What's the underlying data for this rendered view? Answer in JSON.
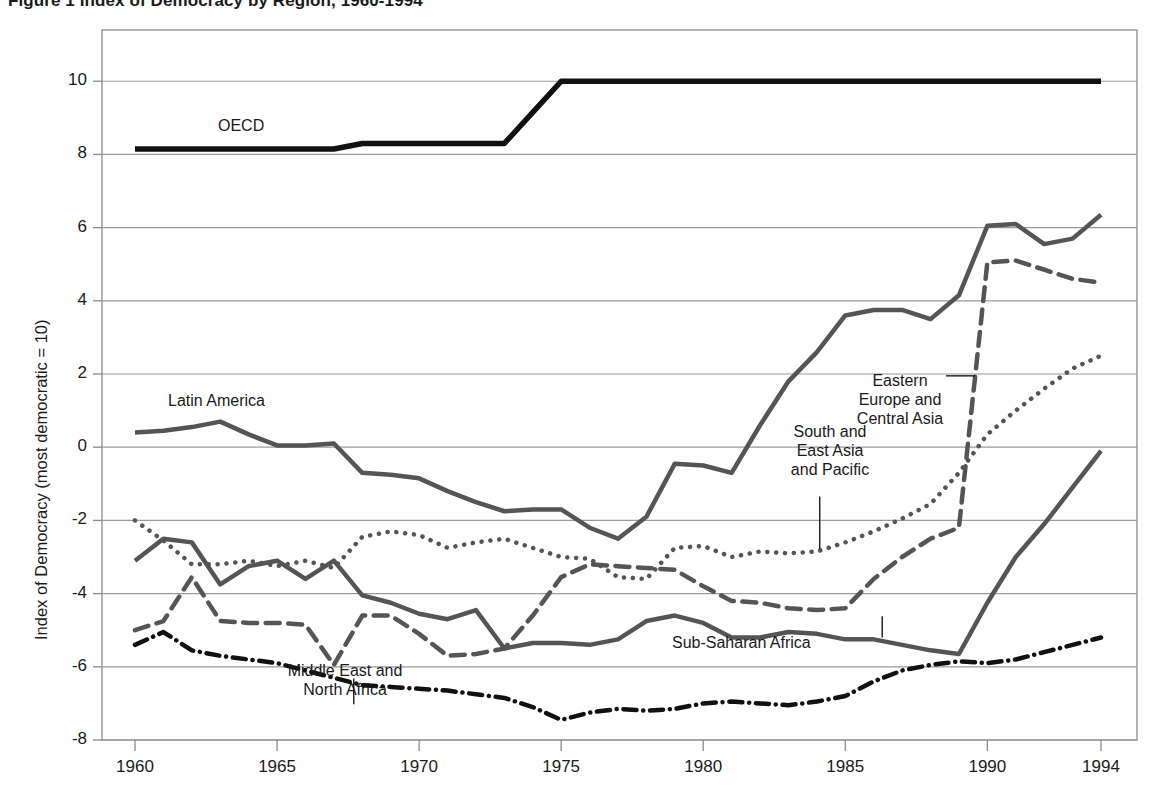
{
  "figure": {
    "title": "Figure 1  Index of Democracy by Region, 1960-1994",
    "ylabel": "Index of Democracy (most democratic = 10)"
  },
  "axes": {
    "y_ticks": [
      "10",
      "8",
      "6",
      "4",
      "2",
      "0",
      "-2",
      "-4",
      "-6",
      "-8"
    ],
    "x_ticks": [
      "1960",
      "1965",
      "1970",
      "1975",
      "1980",
      "1985",
      "1990",
      "1994"
    ]
  },
  "labels": {
    "oecd": "OECD",
    "latin_america": "Latin America",
    "eastern_europe": "Eastern\nEurope and\nCentral Asia",
    "south_east_asia": "South and\nEast Asia\nand Pacific",
    "sub_saharan": "Sub-Saharan Africa",
    "middle_east": "Middle East and\nNorth Africa"
  },
  "colors": {
    "oecd": "#111111",
    "latin_america": "#555555",
    "eastern_europe": "#555555",
    "south_east_asia": "#555555",
    "sub_saharan": "#555555",
    "middle_east": "#111111",
    "grid": "#9a9a9a",
    "axis": "#8a8a8a"
  },
  "chart_data": {
    "type": "line",
    "title": "Index of Democracy by Region, 1960-1994",
    "xlabel": "",
    "ylabel": "Index of Democracy (most democratic = 10)",
    "xlim": [
      1959,
      1995
    ],
    "ylim": [
      -8,
      11.4
    ],
    "ytick_values": [
      10,
      8,
      6,
      4,
      2,
      0,
      -2,
      -4,
      -6,
      -8
    ],
    "xtick_values": [
      1960,
      1965,
      1970,
      1975,
      1980,
      1985,
      1990,
      1994
    ],
    "grid": "horizontal",
    "legend": "inline-annotations",
    "x": [
      1960,
      1961,
      1962,
      1963,
      1964,
      1965,
      1966,
      1967,
      1968,
      1969,
      1970,
      1971,
      1972,
      1973,
      1974,
      1975,
      1976,
      1977,
      1978,
      1979,
      1980,
      1981,
      1982,
      1983,
      1984,
      1985,
      1986,
      1987,
      1988,
      1989,
      1990,
      1991,
      1992,
      1993,
      1994
    ],
    "series": [
      {
        "name": "OECD",
        "style": "solid",
        "color": "#111111",
        "width": 5.5,
        "values": [
          8.15,
          8.15,
          8.15,
          8.15,
          8.15,
          8.15,
          8.15,
          8.15,
          8.3,
          8.3,
          8.3,
          8.3,
          8.3,
          8.3,
          9.15,
          10.0,
          10.0,
          10.0,
          10.0,
          10.0,
          10.0,
          10.0,
          10.0,
          10.0,
          10.0,
          10.0,
          10.0,
          10.0,
          10.0,
          10.0,
          10.0,
          10.0,
          10.0,
          10.0,
          10.0
        ]
      },
      {
        "name": "Latin America",
        "style": "solid",
        "color": "#555555",
        "width": 4.5,
        "values": [
          0.4,
          0.45,
          0.55,
          0.7,
          0.35,
          0.05,
          0.05,
          0.1,
          -0.7,
          -0.75,
          -0.85,
          -1.2,
          -1.5,
          -1.75,
          -1.7,
          -1.7,
          -2.2,
          -2.5,
          -1.9,
          -0.45,
          -0.5,
          -0.7,
          0.6,
          1.8,
          2.6,
          3.6,
          3.75,
          3.75,
          3.5,
          4.15,
          6.05,
          6.1,
          5.55,
          5.7,
          6.35
        ]
      },
      {
        "name": "Eastern Europe and Central Asia",
        "style": "dashed",
        "color": "#555555",
        "width": 4.5,
        "values": [
          -5.0,
          -4.75,
          -3.55,
          -4.75,
          -4.8,
          -4.8,
          -4.85,
          -5.95,
          -4.6,
          -4.6,
          -5.1,
          -5.7,
          -5.65,
          -5.5,
          -4.6,
          -3.55,
          -3.2,
          -3.25,
          -3.3,
          -3.35,
          -3.8,
          -4.2,
          -4.25,
          -4.4,
          -4.45,
          -4.4,
          -3.6,
          -3.0,
          -2.5,
          -2.2,
          5.05,
          5.1,
          4.85,
          4.6,
          4.5
        ]
      },
      {
        "name": "South and East Asia and Pacific",
        "style": "dotted",
        "color": "#555555",
        "width": 4.5,
        "values": [
          -2.0,
          -2.55,
          -3.2,
          -3.2,
          -3.1,
          -3.25,
          -3.1,
          -3.3,
          -2.45,
          -2.3,
          -2.4,
          -2.75,
          -2.6,
          -2.5,
          -2.75,
          -3.0,
          -3.05,
          -3.55,
          -3.6,
          -2.75,
          -2.7,
          -3.0,
          -2.85,
          -2.9,
          -2.85,
          -2.6,
          -2.3,
          -1.95,
          -1.55,
          -0.7,
          0.35,
          1.0,
          1.6,
          2.15,
          2.5
        ]
      },
      {
        "name": "Sub-Saharan Africa",
        "style": "solid",
        "color": "#555555",
        "width": 4.5,
        "values": [
          -3.1,
          -2.5,
          -2.6,
          -3.75,
          -3.25,
          -3.1,
          -3.6,
          -3.1,
          -4.05,
          -4.25,
          -4.55,
          -4.7,
          -4.45,
          -5.5,
          -5.35,
          -5.35,
          -5.4,
          -5.25,
          -4.75,
          -4.6,
          -4.8,
          -5.2,
          -5.2,
          -5.05,
          -5.1,
          -5.25,
          -5.25,
          -5.4,
          -5.55,
          -5.65,
          -4.25,
          -3.0,
          -2.1,
          -1.1,
          -0.1
        ]
      },
      {
        "name": "Middle East and North Africa",
        "style": "dashdot",
        "color": "#111111",
        "width": 4.5,
        "values": [
          -5.4,
          -5.05,
          -5.55,
          -5.7,
          -5.8,
          -5.9,
          -6.1,
          -6.3,
          -6.5,
          -6.55,
          -6.6,
          -6.65,
          -6.75,
          -6.85,
          -7.1,
          -7.45,
          -7.25,
          -7.15,
          -7.2,
          -7.15,
          -7.0,
          -6.95,
          -7.0,
          -7.05,
          -6.95,
          -6.8,
          -6.4,
          -6.1,
          -5.95,
          -5.85,
          -5.9,
          -5.8,
          -5.6,
          -5.4,
          -5.2
        ]
      }
    ],
    "annotations": [
      {
        "text": "OECD",
        "x": 1963.0,
        "y": 8.85
      },
      {
        "text": "Latin America",
        "x": 1962.5,
        "y": 1.35
      },
      {
        "text": "Eastern Europe and Central Asia",
        "x": 1986.0,
        "y": 1.95,
        "leader": true
      },
      {
        "text": "South and East Asia and Pacific",
        "x": 1982.8,
        "y": -0.6,
        "leader": true
      },
      {
        "text": "Sub-Saharan Africa",
        "x": 1985.0,
        "y": -5.15,
        "leader": true
      },
      {
        "text": "Middle East and North Africa",
        "x": 1967.5,
        "y": -7.1,
        "leader": true
      }
    ]
  }
}
